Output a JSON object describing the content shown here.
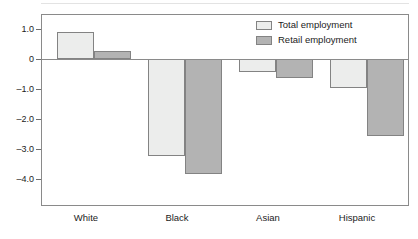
{
  "chart_data": {
    "type": "bar",
    "title": "",
    "subtitle": "",
    "xlabel": "",
    "ylabel": "",
    "categories": [
      "White",
      "Black",
      "Asian",
      "Hispanic"
    ],
    "series": [
      {
        "name": "Total employment",
        "color": "#ecedec",
        "values": [
          0.9,
          -3.22,
          -0.43,
          -0.97
        ]
      },
      {
        "name": "Retail employment",
        "color": "#b3b3b3",
        "values": [
          0.28,
          -3.82,
          -0.63,
          -2.55
        ]
      }
    ],
    "ylim": [
      -4.8,
      1.6
    ],
    "yticks": [
      1.0,
      0,
      -1.0,
      -2.0,
      -3.0,
      -4.0
    ],
    "ytick_labels": [
      "1.0",
      "0",
      "–1.0",
      "–2.0",
      "–3.0",
      "–4.0"
    ],
    "grid": false,
    "zero_line": true,
    "legend_position": "top-right",
    "bar_border_color": "#838383",
    "axis_color": "#8a8a8a",
    "text_color": "#1c1c1c"
  },
  "legend": {
    "items": [
      {
        "label": "Total employment",
        "swatch": "light"
      },
      {
        "label": "Retail employment",
        "swatch": "gray"
      }
    ]
  },
  "axis": {
    "y_labels": [
      "1.0",
      "0",
      "–1.0",
      "–2.0",
      "–3.0",
      "–4.0"
    ],
    "x_labels": [
      "White",
      "Black",
      "Asian",
      "Hispanic"
    ]
  }
}
